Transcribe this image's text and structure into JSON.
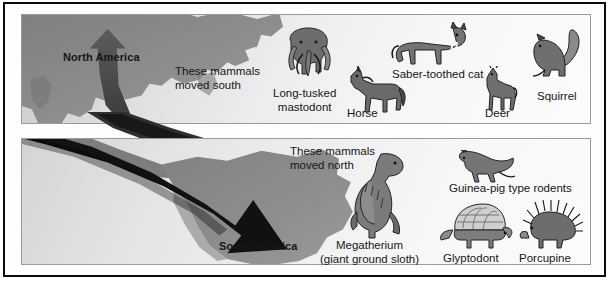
{
  "figure": {
    "type": "great-american-interchange-diagram",
    "panels": [
      {
        "id": "north",
        "continent_label": "North America",
        "caption": "These mammals\nmoved south",
        "caption_line1": "These mammals",
        "caption_line2": "moved south",
        "arrow_direction": "up",
        "animals": [
          {
            "name_line1": "Long-tusked",
            "name_line2": "mastodont",
            "icon": "mastodont-icon"
          },
          {
            "name_line1": "Horse",
            "name_line2": "",
            "icon": "horse-icon"
          },
          {
            "name_line1": "Saber-toothed cat",
            "name_line2": "",
            "icon": "saber-toothed-cat-icon"
          },
          {
            "name_line1": "Deer",
            "name_line2": "",
            "icon": "deer-icon"
          },
          {
            "name_line1": "Squirrel",
            "name_line2": "",
            "icon": "squirrel-icon"
          }
        ]
      },
      {
        "id": "south",
        "continent_label": "South America",
        "caption_line1": "These mammals",
        "caption_line2": "moved north",
        "arrow_direction": "down-right",
        "animals": [
          {
            "name_line1": "Megatherium",
            "name_line2": "(giant ground sloth)",
            "icon": "megatherium-icon"
          },
          {
            "name_line1": "Guinea-pig type rodents",
            "name_line2": "",
            "icon": "guinea-pig-rodent-icon"
          },
          {
            "name_line1": "Glyptodont",
            "name_line2": "",
            "icon": "glyptodont-icon"
          },
          {
            "name_line1": "Porcupine",
            "name_line2": "",
            "icon": "porcupine-icon"
          }
        ]
      }
    ]
  },
  "colors": {
    "frame": "#0b0b0b",
    "landmass": "#8a8a8a",
    "landmass_dark": "#6f6f6f",
    "arrow_north": "#4a4a4a",
    "arrow_south": "#111111",
    "text": "#161616",
    "panel_border": "#9a9a9a"
  },
  "labels": {
    "north_america": "North America",
    "south_america": "South America",
    "moved_south_l1": "These mammals",
    "moved_south_l2": "moved south",
    "moved_north_l1": "These mammals",
    "moved_north_l2": "moved north",
    "mastodont_l1": "Long-tusked",
    "mastodont_l2": "mastodont",
    "horse": "Horse",
    "saber": "Saber-toothed cat",
    "deer": "Deer",
    "squirrel": "Squirrel",
    "megatherium_l1": "Megatherium",
    "megatherium_l2": "(giant ground sloth)",
    "rodents": "Guinea-pig type rodents",
    "glyptodont": "Glyptodont",
    "porcupine": "Porcupine"
  }
}
